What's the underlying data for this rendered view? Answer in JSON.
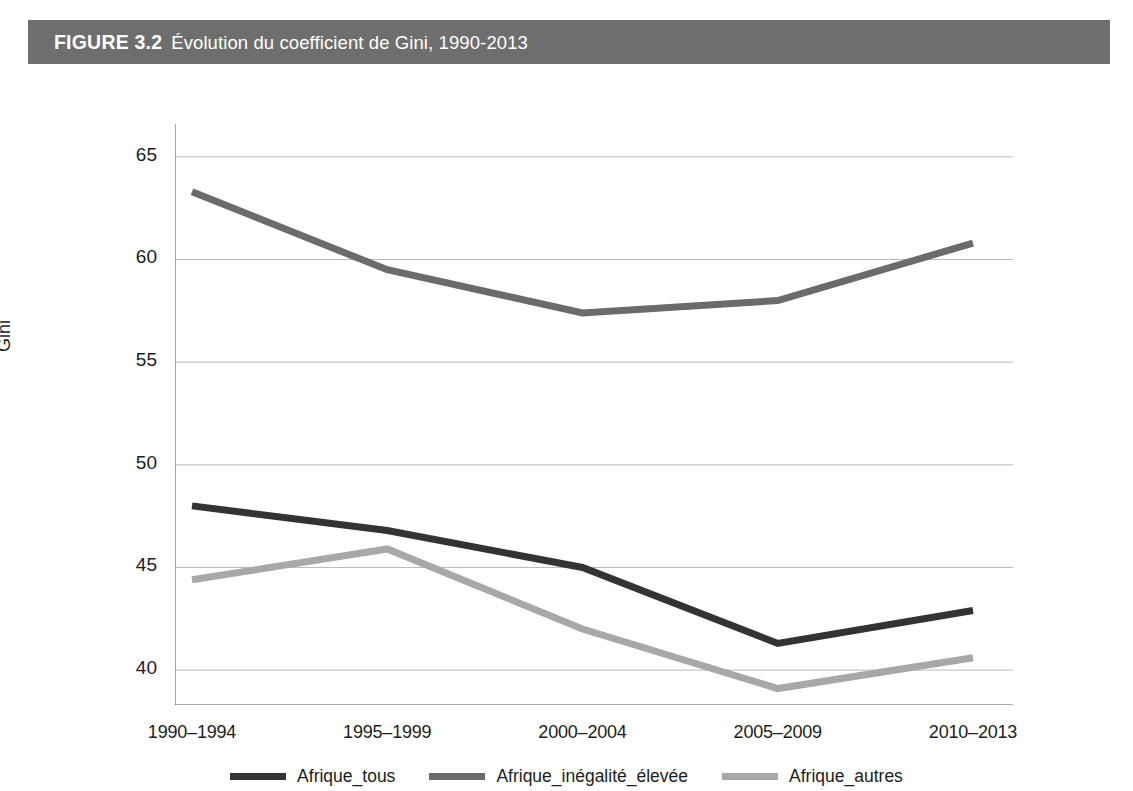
{
  "banner": {
    "figure_label": "FIGURE 3.2",
    "figure_title": "Évolution du coefficient de Gini, 1990-2013",
    "background_color": "#6e6e6e",
    "text_color": "#ffffff"
  },
  "chart_data": {
    "type": "line",
    "title": "Évolution du coefficient de Gini, 1990-2013",
    "xlabel": "",
    "ylabel": "Gini",
    "categories": [
      "1990–1994",
      "1995–1999",
      "2000–2004",
      "2005–2009",
      "2010–2013"
    ],
    "ylim": [
      38.3,
      66.6
    ],
    "yticks": [
      40,
      45,
      50,
      55,
      60,
      65
    ],
    "grid": true,
    "legend_position": "bottom",
    "series": [
      {
        "name": "Afrique_tous",
        "color": "#333333",
        "values": [
          48.0,
          46.8,
          45.0,
          41.3,
          42.9
        ]
      },
      {
        "name": "Afrique_inégalité_élevée",
        "color": "#6b6b6b",
        "values": [
          63.3,
          59.5,
          57.4,
          58.0,
          60.8
        ]
      },
      {
        "name": "Afrique_autres",
        "color": "#a8a8a8",
        "values": [
          44.4,
          45.9,
          42.0,
          39.1,
          40.6
        ]
      }
    ]
  }
}
